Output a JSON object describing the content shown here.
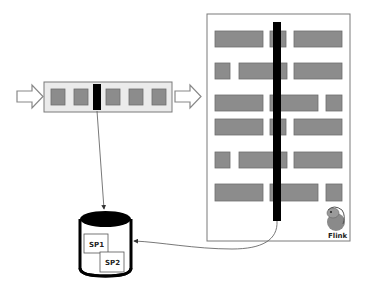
{
  "diagram": {
    "colors": {
      "record": "#8c8c8c",
      "record_border": "#6e6e6e",
      "barrier": "#000000",
      "panel_border": "#7a7a7a",
      "stream_bg": "#ebebeb",
      "line": "#555555"
    },
    "stream": {
      "records": 5,
      "barrier_position": 2
    },
    "operator_panel": {
      "logo_label": "Flink",
      "logo_icon": "squirrel-icon"
    },
    "state_backend": {
      "snapshots": [
        {
          "label": "SP1"
        },
        {
          "label": "SP2"
        }
      ]
    }
  }
}
